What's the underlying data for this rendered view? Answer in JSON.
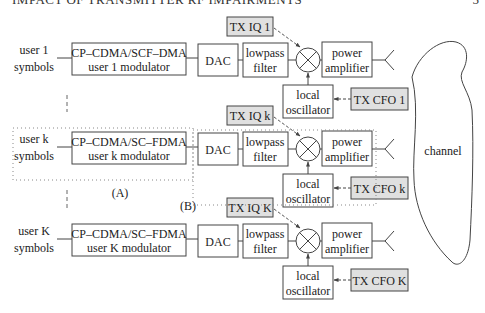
{
  "header": {
    "running_title": "IMPACT OF TRANSMITTER RF IMPAIRMENTS",
    "page_number": "5"
  },
  "diagram": {
    "channel_label": "channel",
    "group_labels": {
      "A": "(A)",
      "B": "(B)"
    },
    "common_blocks": {
      "dac": "DAC",
      "lowpass_line1": "lowpass",
      "lowpass_line2": "filter",
      "pa_line1": "power",
      "pa_line2": "amplifier",
      "lo_line1": "local",
      "lo_line2": "oscillator"
    },
    "users": [
      {
        "id": "1",
        "input_line1": "user 1",
        "input_line2": "symbols",
        "modulator_line1": "CP–CDMA/SCF–DMA",
        "modulator_line2": "user 1 modulator",
        "iq_label": "TX IQ 1",
        "cfo_label": "TX CFO 1"
      },
      {
        "id": "k",
        "input_line1": "user k",
        "input_line2": "symbols",
        "modulator_line1": "CP–CDMA/SC–FDMA",
        "modulator_line2": "user k modulator",
        "iq_label": "TX IQ k",
        "cfo_label": "TX CFO k"
      },
      {
        "id": "K",
        "input_line1": "user K",
        "input_line2": "symbols",
        "modulator_line1": "CP–CDMA/SC–FDMA",
        "modulator_line2": "user K modulator",
        "iq_label": "TX IQ K",
        "cfo_label": "TX CFO K"
      }
    ],
    "colors": {
      "impairment_fill": "#e0e0e0",
      "stroke": "#444444",
      "background": "#ffffff"
    }
  }
}
